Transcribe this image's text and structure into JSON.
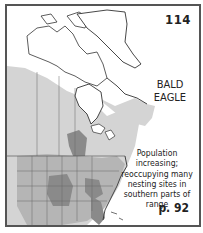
{
  "plate": {
    "number": "114",
    "species_line1": "BALD",
    "species_line2": "EAGLE",
    "note": "Population increasing; reoccupying many nesting sites in southern parts of range",
    "page_ref": "p. 92"
  },
  "map": {
    "region": "North America",
    "legend_colors": {
      "range": "#d4d4d4",
      "states": "#b5b5b5",
      "dense": "#8a8a8a",
      "background": "#ffffff",
      "outline": "#333333"
    }
  }
}
